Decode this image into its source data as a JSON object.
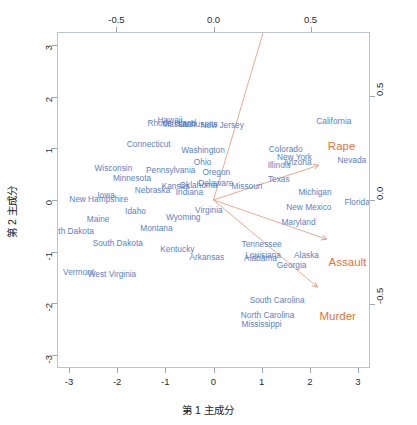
{
  "figure": {
    "type": "biplot",
    "x_axis_title": "第 1 主成分",
    "y_axis_title": "第 2 主成分"
  },
  "axes": {
    "bottom_ticks": [
      "-3",
      "-2",
      "-1",
      "0",
      "1",
      "2",
      "3"
    ],
    "left_ticks": [
      "3",
      "2",
      "1",
      "0",
      "-1",
      "-2",
      "-3"
    ],
    "top_ticks": [
      "-0.5",
      "0.0",
      "0.5"
    ],
    "right_ticks": [
      "0.5",
      "0.0",
      "-0.5"
    ],
    "bottom_values": [
      -3,
      -2,
      -1,
      0,
      1,
      2,
      3
    ],
    "left_values": [
      3,
      2,
      1,
      0,
      -1,
      -2,
      -3
    ],
    "top_values": [
      -0.5,
      0.0,
      0.5
    ],
    "right_values": [
      0.5,
      0.0,
      -0.5
    ],
    "xlim": [
      -3.25,
      3.25
    ],
    "ylim": [
      -3.25,
      3.25
    ],
    "xlim_secondary": [
      -0.8062,
      0.8062
    ],
    "ylim_secondary": [
      -0.8062,
      0.8062
    ]
  },
  "colors": {
    "observation": "#5b7fc7",
    "variable": "#e8743b",
    "frame": "#b9c3d6",
    "tick_text": "#2b2b2b",
    "background": "#ffffff"
  },
  "chart_data": {
    "type": "scatter",
    "title": "",
    "xlabel": "第 1 主成分",
    "ylabel": "第 2 主成分",
    "xlim": [
      -3.25,
      3.25
    ],
    "ylim": [
      -3.25,
      3.25
    ],
    "grid": false,
    "legend": "none",
    "observations": [
      {
        "label": "Alabama",
        "x": 0.976,
        "y": -1.122
      },
      {
        "label": "Alaska",
        "x": 1.931,
        "y": -1.062
      },
      {
        "label": "Arizona",
        "x": 1.745,
        "y": 0.738
      },
      {
        "label": "Arkansas",
        "x": -0.14,
        "y": -1.109
      },
      {
        "label": "California",
        "x": 2.499,
        "y": 1.527
      },
      {
        "label": "Colorado",
        "x": 1.499,
        "y": 0.978
      },
      {
        "label": "Connecticut",
        "x": -1.345,
        "y": 1.077
      },
      {
        "label": "Delaware",
        "x": 0.047,
        "y": 0.322
      },
      {
        "label": "Florida",
        "x": 2.982,
        "y": -0.039
      },
      {
        "label": "Georgia",
        "x": 1.622,
        "y": -1.266
      },
      {
        "label": "Hawaii",
        "x": -0.903,
        "y": 1.55
      },
      {
        "label": "Idaho",
        "x": -1.62,
        "y": -0.21
      },
      {
        "label": "Illinois",
        "x": 1.365,
        "y": 0.675
      },
      {
        "label": "Indiana",
        "x": -0.5,
        "y": 0.151
      },
      {
        "label": "Iowa",
        "x": -2.231,
        "y": 0.102
      },
      {
        "label": "Kansas",
        "x": -0.789,
        "y": 0.267
      },
      {
        "label": "Kentucky",
        "x": -0.75,
        "y": -0.955
      },
      {
        "label": "Louisiana",
        "x": 1.03,
        "y": -1.063
      },
      {
        "label": "Maine",
        "x": -2.396,
        "y": -0.376
      },
      {
        "label": "Maryland",
        "x": 1.764,
        "y": -0.428
      },
      {
        "label": "Massachusetts",
        "x": -0.486,
        "y": 1.474
      },
      {
        "label": "Michigan",
        "x": 2.108,
        "y": 0.155
      },
      {
        "label": "Minnesota",
        "x": -1.692,
        "y": 0.422
      },
      {
        "label": "Mississippi",
        "x": 0.996,
        "y": -2.394
      },
      {
        "label": "Missouri",
        "x": 0.696,
        "y": 0.263
      },
      {
        "label": "Montana",
        "x": -1.185,
        "y": -0.537
      },
      {
        "label": "Nebraska",
        "x": -1.266,
        "y": 0.194
      },
      {
        "label": "Nevada",
        "x": 2.874,
        "y": 0.776
      },
      {
        "label": "New Hampshire",
        "x": -2.383,
        "y": 0.018
      },
      {
        "label": "New Jersey",
        "x": 0.181,
        "y": 1.449
      },
      {
        "label": "New Mexico",
        "x": 1.98,
        "y": -0.142
      },
      {
        "label": "New York",
        "x": 1.682,
        "y": 0.823
      },
      {
        "label": "North Carolina",
        "x": 1.123,
        "y": -2.228
      },
      {
        "label": "North Dakota",
        "x": -2.992,
        "y": -0.599
      },
      {
        "label": "Ohio",
        "x": -0.226,
        "y": 0.742
      },
      {
        "label": "Oklahoma",
        "x": -0.312,
        "y": 0.287
      },
      {
        "label": "Oregon",
        "x": 0.059,
        "y": 0.541
      },
      {
        "label": "Pennsylvania",
        "x": -0.889,
        "y": 0.571
      },
      {
        "label": "Rhode Island",
        "x": -0.864,
        "y": 1.492
      },
      {
        "label": "South Carolina",
        "x": 1.321,
        "y": -1.933
      },
      {
        "label": "South Dakota",
        "x": -1.988,
        "y": -0.823
      },
      {
        "label": "Tennessee",
        "x": 0.999,
        "y": -0.86
      },
      {
        "label": "Texas",
        "x": 1.355,
        "y": 0.412
      },
      {
        "label": "Utah",
        "x": -0.551,
        "y": 1.471
      },
      {
        "label": "Vermont",
        "x": -2.802,
        "y": -1.402
      },
      {
        "label": "Virginia",
        "x": -0.096,
        "y": -0.195
      },
      {
        "label": "Washington",
        "x": -0.217,
        "y": 0.97
      },
      {
        "label": "West Virginia",
        "x": -2.109,
        "y": -1.424
      },
      {
        "label": "Wisconsin",
        "x": -2.079,
        "y": 0.612
      },
      {
        "label": "Wyoming",
        "x": -0.629,
        "y": -0.321
      }
    ],
    "variables": [
      {
        "label": "Murder",
        "x": 0.536,
        "y": -0.418,
        "label_x": 0.64,
        "label_y": -0.56
      },
      {
        "label": "Assault",
        "x": 0.583,
        "y": -0.188,
        "label_x": 0.69,
        "label_y": -0.3
      },
      {
        "label": "UrbanPop",
        "x": 0.278,
        "y": 0.873,
        "label_x": 0.278,
        "label_y": 0.985
      },
      {
        "label": "Rape",
        "x": 0.543,
        "y": 0.167,
        "label_x": 0.66,
        "label_y": 0.255
      }
    ]
  }
}
